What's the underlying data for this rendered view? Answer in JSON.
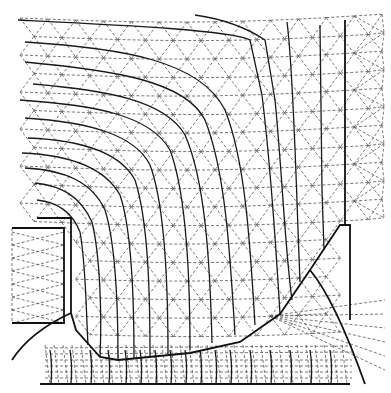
{
  "diagram": {
    "type": "finite-element-mesh-with-equipotential-lines",
    "canvas": {
      "width": 391,
      "height": 393,
      "background": "#ffffff"
    },
    "colors": {
      "mesh": "#555555",
      "contour": "#1a1a1a",
      "boundary": "#111111"
    },
    "boundaries": [
      {
        "name": "left-electrode-block",
        "points": [
          [
            12,
            228
          ],
          [
            64,
            228
          ],
          [
            64,
            323
          ],
          [
            12,
            323
          ]
        ]
      },
      {
        "name": "inner-step",
        "points": [
          [
            37,
            218
          ],
          [
            71,
            218
          ],
          [
            71,
            313
          ],
          [
            76,
            330
          ],
          [
            100,
            357
          ],
          [
            118,
            360
          ],
          [
            190,
            353
          ],
          [
            240,
            342
          ],
          [
            280,
            314
          ],
          [
            310,
            270
          ],
          [
            340,
            225
          ],
          [
            345,
            225
          ],
          [
            345,
            20
          ]
        ]
      },
      {
        "name": "right-wall",
        "points": [
          [
            345,
            225
          ],
          [
            350,
            225
          ],
          [
            350,
            320
          ]
        ]
      },
      {
        "name": "bottom-base",
        "points": [
          [
            40,
            384
          ],
          [
            350,
            384
          ]
        ]
      },
      {
        "name": "lower-left-arc",
        "points": [
          [
            12,
            360
          ],
          [
            30,
            332
          ],
          [
            71,
            313
          ]
        ]
      },
      {
        "name": "lower-right-arc",
        "points": [
          [
            310,
            270
          ],
          [
            335,
            300
          ],
          [
            355,
            345
          ],
          [
            365,
            384
          ]
        ]
      }
    ],
    "contours": [
      "M18,20 C120,25 230,30 250,40 L262,95 C270,160 275,230 280,314",
      "M25,42 C120,48 200,60 225,110 C245,160 250,240 255,325",
      "M25,62 C110,70 185,80 205,120 C225,170 230,250 235,335",
      "M33,84 C105,90 165,100 185,135 C205,180 210,260 212,343",
      "M20,100 C95,105 150,115 170,150 C185,190 190,270 190,350",
      "M25,118 C90,122 135,135 150,165 C165,205 168,280 168,354",
      "M28,138 C80,140 120,152 135,180 C148,220 150,290 150,356",
      "M22,153 C70,155 105,168 120,195 C132,230 134,300 134,358",
      "M25,168 C65,170 92,182 105,210 C116,245 118,310 118,360",
      "M35,183 C62,186 80,196 92,222 C100,255 102,315 100,357",
      "M37,200 C58,202 72,212 80,232 C86,265 86,310 88,345",
      "M195,15 C230,20 250,30 265,40 L275,100 C282,170 285,250 292,300",
      "M287,22 C292,60 295,140 298,230 L300,282",
      "M320,25 L322,190 L324,250"
    ],
    "lower_region": {
      "note": "dense radial mesh with short vertical contours below the lower boundary",
      "vertical_contour_x": [
        50,
        70,
        90,
        108,
        125,
        140,
        155,
        170,
        185,
        200,
        215,
        230,
        250,
        270,
        290,
        310,
        330
      ],
      "y_range": [
        345,
        384
      ]
    },
    "mesh": {
      "note": "dashed triangular finite element mesh covering the field region",
      "top_nodes_y": 18,
      "left_x": 20,
      "right_x": 385,
      "rows": 18
    }
  }
}
